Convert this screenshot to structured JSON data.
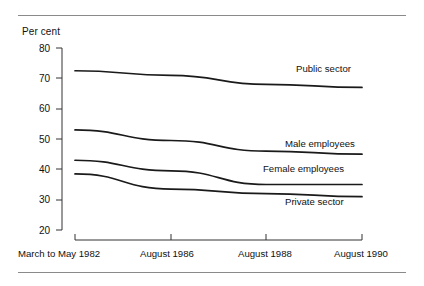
{
  "chart_data": {
    "type": "line",
    "title": "",
    "subtitle": "",
    "xlabel": "",
    "ylabel": "Per cent",
    "ylim": [
      20,
      80
    ],
    "yticks": [
      20,
      30,
      40,
      50,
      60,
      70,
      80
    ],
    "ytick_labels": [
      "20",
      "30",
      "40",
      "50",
      "60",
      "70",
      "80"
    ],
    "grid": false,
    "legend_position": "inline-right",
    "categories": [
      "March to May 1982",
      "August 1986",
      "August 1988",
      "August 1990"
    ],
    "series": [
      {
        "name": "Public sector",
        "values": [
          72.5,
          71.0,
          68.0,
          67.0
        ],
        "color": "#1a1a1a"
      },
      {
        "name": "Male employees",
        "values": [
          53.0,
          49.5,
          46.0,
          45.0
        ],
        "color": "#1a1a1a"
      },
      {
        "name": "Female employees",
        "values": [
          43.0,
          39.5,
          35.0,
          35.0
        ],
        "color": "#1a1a1a"
      },
      {
        "name": "Private sector",
        "values": [
          38.5,
          33.5,
          32.0,
          31.0
        ],
        "color": "#1a1a1a"
      }
    ],
    "annotations": [
      {
        "text": "Public sector",
        "x": 0.8,
        "y": 70.5
      },
      {
        "text": "Male employees",
        "x": 0.78,
        "y": 48.0
      },
      {
        "text": "Female employees",
        "x": 0.72,
        "y": 39.0
      },
      {
        "text": "Private sector",
        "x": 0.78,
        "y": 30.0
      }
    ]
  },
  "axes": {
    "y_unit_label": "Per cent",
    "y_tick_labels": [
      "80",
      "70",
      "60",
      "50",
      "40",
      "30",
      "20"
    ],
    "x_tick_labels": [
      "March to May 1982",
      "August 1986",
      "August 1988",
      "August 1990"
    ]
  },
  "series_labels": {
    "public": "Public sector",
    "male": "Male employees",
    "female": "Female employees",
    "private": "Private sector"
  },
  "colors": {
    "line": "#1a1a1a",
    "axis": "#333333",
    "rule": "#8a8a8a",
    "background": "#ffffff"
  }
}
